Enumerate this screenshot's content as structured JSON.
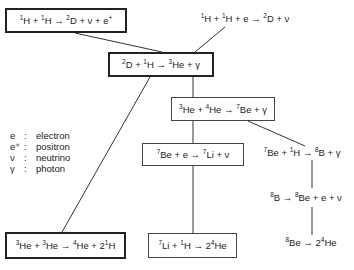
{
  "diagram": {
    "reactions": {
      "pp": {
        "html": "<sup>1</sup>H + <sup>1</sup>H → <sup>2</sup>D + ν + e<sup>+</sup>",
        "text": "1H + 1H → 2D + ν + e+"
      },
      "pep": {
        "html": "<sup>1</sup>H + <sup>1</sup>H + e → <sup>2</sup>D + ν",
        "text": "1H + 1H + e → 2D + ν"
      },
      "d_capture": {
        "html": "<sup>2</sup>D + <sup>1</sup>H → <sup>3</sup>He + γ",
        "text": "2D + 1H → 3He + γ"
      },
      "he3_he4": {
        "html": "<sup>3</sup>He + <sup>4</sup>He → <sup>7</sup>Be + γ",
        "text": "3He + 4He → 7Be + γ"
      },
      "be7_e": {
        "html": "<sup>7</sup>Be + e → <sup>7</sup>Li + ν",
        "text": "7Be + e → 7Li + ν"
      },
      "be7_p": {
        "html": "<sup>7</sup>Be + <sup>1</sup>H → <sup>8</sup>B + γ",
        "text": "7Be + 1H → 8B + γ"
      },
      "b8_decay": {
        "html": "<sup>8</sup>B → <sup>8</sup>Be + e + ν",
        "text": "8B → 8Be + e + ν"
      },
      "be8_decay": {
        "html": "<sup>8</sup>Be → 2<sup>4</sup>He",
        "text": "8Be → 24He"
      },
      "he3_he3": {
        "html": "<sup>3</sup>He + <sup>3</sup>He → <sup>4</sup>He + 2<sup>1</sup>H",
        "text": "3He + 3He → 4He + 21H"
      },
      "li7_p": {
        "html": "<sup>7</sup>Li + <sup>1</sup>H → 2<sup>4</sup>He",
        "text": "7Li + 1H → 24He"
      }
    },
    "legend": [
      {
        "symbol": "e",
        "separator": ":",
        "meaning": "electron"
      },
      {
        "symbol": "e⁺",
        "separator": ":",
        "meaning": "positron"
      },
      {
        "symbol": "ν",
        "separator": ":",
        "meaning": "neutrino"
      },
      {
        "symbol": "γ",
        "separator": ":",
        "meaning": "photon"
      }
    ],
    "colors": {
      "line": "#333333",
      "text": "#222222",
      "background": "#ffffff"
    }
  }
}
